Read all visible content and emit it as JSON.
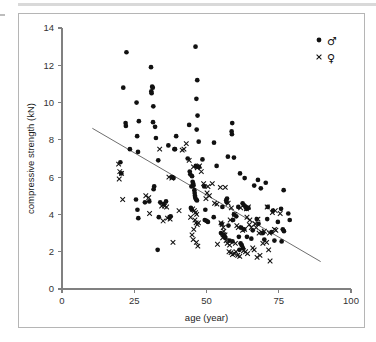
{
  "figure": {
    "domain": "chart",
    "background_color": "#ffffff",
    "frame_color": "#b5b5b5",
    "top_rule_color": "#d9d9d9"
  },
  "chart_data": {
    "type": "scatter",
    "title": "",
    "subtitle": "",
    "xlabel": "age (year)",
    "ylabel": "compressive strength (kN)",
    "xlim": [
      0,
      100
    ],
    "ylim": [
      0,
      14
    ],
    "xticks": [
      0,
      25,
      50,
      75,
      100
    ],
    "yticks": [
      0,
      2,
      4,
      6,
      8,
      10,
      12,
      14
    ],
    "xtick_labels": [
      "0",
      "25",
      "50",
      "75",
      "100"
    ],
    "ytick_labels": [
      "0",
      "2",
      "4",
      "6",
      "8",
      "10",
      "12",
      "14"
    ],
    "grid": false,
    "legend_position": "top-right",
    "legend": [
      {
        "label": "♂",
        "name": "male",
        "marker": "filled-circle",
        "color": "#111111"
      },
      {
        "label": "♀",
        "name": "female",
        "marker": "cross",
        "color": "#111111"
      }
    ],
    "annotations": [
      {
        "type": "regression-line",
        "name": "trend-line",
        "x": [
          10.5,
          89.5
        ],
        "y": [
          8.62,
          1.47
        ],
        "color": "#6e6e6e"
      }
    ],
    "series": [
      {
        "name": "male",
        "marker": "filled-circle",
        "color": "#111111",
        "points": [
          [
            22.3,
            12.7
          ],
          [
            46.2,
            13.0
          ],
          [
            30.8,
            11.9
          ],
          [
            46.8,
            11.2
          ],
          [
            21.2,
            10.8
          ],
          [
            31.2,
            10.85
          ],
          [
            31.4,
            10.8
          ],
          [
            30.9,
            10.6
          ],
          [
            31.0,
            10.5
          ],
          [
            46.5,
            10.2
          ],
          [
            25.8,
            10.0
          ],
          [
            31.6,
            9.8
          ],
          [
            46.9,
            9.3
          ],
          [
            26.6,
            9.0
          ],
          [
            58.9,
            8.9
          ],
          [
            31.5,
            8.95
          ],
          [
            22.0,
            8.9
          ],
          [
            22.1,
            8.75
          ],
          [
            44.0,
            8.8
          ],
          [
            32.2,
            8.7
          ],
          [
            58.7,
            8.45
          ],
          [
            58.8,
            8.3
          ],
          [
            46.6,
            8.55
          ],
          [
            32.5,
            8.1
          ],
          [
            26.0,
            8.2
          ],
          [
            39.5,
            8.2
          ],
          [
            52.6,
            7.85
          ],
          [
            47.3,
            7.9
          ],
          [
            36.8,
            7.7
          ],
          [
            38.9,
            7.5
          ],
          [
            23.5,
            7.5
          ],
          [
            26.3,
            7.35
          ],
          [
            39.1,
            7.5
          ],
          [
            33.3,
            6.9
          ],
          [
            59.5,
            7.05
          ],
          [
            57.4,
            7.1
          ],
          [
            48.6,
            6.95
          ],
          [
            43.5,
            7.0
          ],
          [
            20.2,
            6.8
          ],
          [
            46.3,
            6.6
          ],
          [
            53.5,
            6.6
          ],
          [
            47.4,
            6.55
          ],
          [
            44.2,
            6.3
          ],
          [
            44.4,
            6.15
          ],
          [
            20.5,
            6.2
          ],
          [
            61.6,
            6.2
          ],
          [
            45.0,
            6.05
          ],
          [
            38.2,
            6.0
          ],
          [
            38.6,
            5.95
          ],
          [
            63.2,
            5.95
          ],
          [
            67.8,
            5.85
          ],
          [
            45.2,
            5.75
          ],
          [
            45.4,
            5.65
          ],
          [
            45.5,
            5.55
          ],
          [
            44.8,
            5.5
          ],
          [
            70.5,
            5.7
          ],
          [
            66.5,
            5.55
          ],
          [
            76.7,
            5.3
          ],
          [
            68.8,
            5.4
          ],
          [
            49.2,
            5.5
          ],
          [
            31.9,
            5.5
          ],
          [
            31.7,
            5.35
          ],
          [
            45.8,
            5.3
          ],
          [
            45.9,
            5.15
          ],
          [
            46.0,
            5.0
          ],
          [
            46.1,
            4.9
          ],
          [
            46.4,
            4.8
          ],
          [
            46.7,
            4.75
          ],
          [
            56.8,
            4.75
          ],
          [
            57.1,
            4.85
          ],
          [
            57.0,
            4.65
          ],
          [
            62.5,
            4.6
          ],
          [
            62.9,
            4.5
          ],
          [
            63.5,
            4.4
          ],
          [
            63.8,
            4.3
          ],
          [
            25.6,
            4.8
          ],
          [
            28.7,
            4.65
          ],
          [
            30.2,
            4.7
          ],
          [
            34.0,
            4.65
          ],
          [
            35.2,
            4.55
          ],
          [
            36.0,
            4.7
          ],
          [
            44.6,
            4.35
          ],
          [
            44.9,
            4.25
          ],
          [
            49.6,
            4.25
          ],
          [
            55.5,
            4.4
          ],
          [
            61.0,
            4.4
          ],
          [
            64.5,
            4.35
          ],
          [
            71.2,
            4.4
          ],
          [
            73.0,
            4.2
          ],
          [
            78.3,
            4.05
          ],
          [
            75.8,
            4.3
          ],
          [
            26.1,
            4.25
          ],
          [
            59.5,
            4.0
          ],
          [
            60.3,
            3.9
          ],
          [
            26.4,
            3.8
          ],
          [
            33.5,
            3.85
          ],
          [
            37.2,
            3.85
          ],
          [
            37.6,
            3.9
          ],
          [
            52.5,
            3.85
          ],
          [
            59.2,
            3.7
          ],
          [
            67.4,
            3.75
          ],
          [
            71.0,
            3.75
          ],
          [
            78.8,
            3.7
          ],
          [
            74.7,
            3.6
          ],
          [
            68.0,
            3.5
          ],
          [
            55.2,
            3.5
          ],
          [
            57.6,
            3.4
          ],
          [
            62.0,
            3.3
          ],
          [
            63.0,
            3.2
          ],
          [
            66.0,
            3.15
          ],
          [
            69.5,
            3.0
          ],
          [
            72.5,
            3.05
          ],
          [
            76.4,
            3.2
          ],
          [
            76.8,
            3.1
          ],
          [
            55.0,
            3.0
          ],
          [
            55.8,
            2.9
          ],
          [
            56.2,
            2.85
          ],
          [
            56.5,
            2.75
          ],
          [
            61.2,
            2.8
          ],
          [
            64.0,
            2.8
          ],
          [
            65.5,
            2.7
          ],
          [
            70.0,
            2.65
          ],
          [
            73.5,
            2.6
          ],
          [
            76.0,
            2.55
          ],
          [
            61.8,
            2.45
          ],
          [
            62.2,
            2.35
          ],
          [
            62.6,
            2.2
          ],
          [
            61.4,
            2.1
          ],
          [
            33.1,
            2.1
          ],
          [
            58.0,
            2.6
          ],
          [
            59.0,
            2.55
          ],
          [
            50.5,
            3.6
          ],
          [
            50.0,
            3.65
          ],
          [
            49.4,
            3.7
          ]
        ]
      },
      {
        "name": "female",
        "marker": "cross",
        "color": "#111111",
        "points": [
          [
            19.6,
            6.7
          ],
          [
            20.0,
            6.3
          ],
          [
            20.6,
            6.2
          ],
          [
            19.8,
            5.9
          ],
          [
            21.0,
            4.8
          ],
          [
            29.0,
            5.0
          ],
          [
            30.0,
            4.9
          ],
          [
            33.8,
            7.5
          ],
          [
            37.0,
            6.0
          ],
          [
            38.0,
            5.95
          ],
          [
            41.6,
            7.45
          ],
          [
            42.2,
            7.5
          ],
          [
            43.0,
            7.8
          ],
          [
            44.0,
            6.9
          ],
          [
            45.5,
            6.55
          ],
          [
            46.8,
            6.5
          ],
          [
            47.6,
            6.6
          ],
          [
            48.2,
            6.3
          ],
          [
            49.0,
            5.65
          ],
          [
            50.5,
            5.5
          ],
          [
            52.0,
            5.65
          ],
          [
            54.8,
            5.45
          ],
          [
            56.5,
            5.45
          ],
          [
            50.2,
            5.15
          ],
          [
            51.0,
            5.0
          ],
          [
            49.8,
            4.85
          ],
          [
            52.8,
            4.6
          ],
          [
            53.6,
            4.55
          ],
          [
            30.3,
            4.05
          ],
          [
            34.5,
            4.45
          ],
          [
            35.5,
            4.45
          ],
          [
            36.2,
            4.4
          ],
          [
            35.0,
            3.65
          ],
          [
            36.5,
            3.8
          ],
          [
            37.4,
            3.75
          ],
          [
            40.5,
            4.2
          ],
          [
            45.2,
            4.3
          ],
          [
            45.8,
            4.2
          ],
          [
            46.2,
            4.1
          ],
          [
            46.6,
            4.0
          ],
          [
            44.5,
            3.85
          ],
          [
            46.0,
            3.7
          ],
          [
            46.4,
            3.55
          ],
          [
            46.8,
            3.45
          ],
          [
            47.2,
            3.55
          ],
          [
            45.6,
            3.2
          ],
          [
            45.0,
            2.9
          ],
          [
            45.4,
            2.65
          ],
          [
            46.5,
            2.5
          ],
          [
            47.0,
            2.3
          ],
          [
            38.4,
            2.5
          ],
          [
            55.0,
            3.55
          ],
          [
            55.4,
            3.45
          ],
          [
            55.8,
            3.3
          ],
          [
            56.0,
            3.1
          ],
          [
            56.4,
            2.9
          ],
          [
            55.6,
            2.75
          ],
          [
            56.8,
            2.6
          ],
          [
            57.2,
            2.45
          ],
          [
            53.8,
            2.4
          ],
          [
            57.8,
            2.0
          ],
          [
            58.5,
            1.95
          ],
          [
            59.0,
            1.85
          ],
          [
            59.6,
            1.9
          ],
          [
            60.2,
            2.0
          ],
          [
            60.8,
            1.8
          ],
          [
            61.5,
            1.75
          ],
          [
            62.8,
            2.05
          ],
          [
            63.5,
            2.0
          ],
          [
            64.2,
            1.9
          ],
          [
            66.0,
            2.2
          ],
          [
            66.5,
            2.1
          ],
          [
            67.5,
            1.7
          ],
          [
            68.5,
            1.8
          ],
          [
            71.5,
            2.1
          ],
          [
            72.0,
            1.5
          ],
          [
            70.8,
            2.5
          ],
          [
            69.5,
            2.45
          ],
          [
            68.2,
            3.0
          ],
          [
            69.0,
            3.05
          ],
          [
            66.8,
            3.5
          ],
          [
            67.2,
            3.3
          ],
          [
            65.5,
            3.3
          ],
          [
            64.8,
            3.45
          ],
          [
            63.2,
            3.2
          ],
          [
            62.5,
            3.15
          ],
          [
            61.0,
            3.3
          ],
          [
            60.5,
            3.4
          ],
          [
            64.0,
            3.85
          ],
          [
            65.0,
            3.7
          ],
          [
            67.8,
            3.75
          ],
          [
            70.0,
            3.1
          ],
          [
            71.8,
            3.0
          ],
          [
            73.5,
            3.2
          ],
          [
            74.0,
            3.15
          ],
          [
            72.8,
            4.1
          ],
          [
            73.8,
            4.2
          ],
          [
            71.0,
            4.4
          ],
          [
            75.5,
            4.05
          ],
          [
            63.8,
            4.3
          ],
          [
            64.5,
            4.4
          ],
          [
            61.8,
            4.35
          ],
          [
            58.6,
            4.35
          ],
          [
            57.5,
            4.6
          ],
          [
            59.8,
            4.0
          ],
          [
            58.2,
            3.7
          ],
          [
            60.0,
            2.45
          ],
          [
            58.0,
            2.35
          ]
        ]
      }
    ]
  }
}
